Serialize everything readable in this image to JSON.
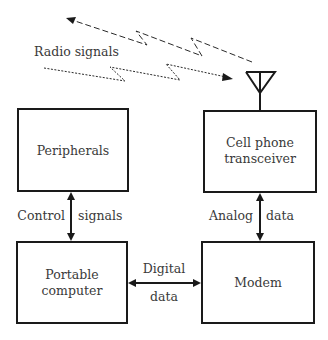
{
  "diagram": {
    "labels": {
      "radio_signals": "Radio signals",
      "control": "Control",
      "signals": "signals",
      "analog": "Analog",
      "analog_data": "data",
      "digital": "Digital",
      "digital_data": "data"
    },
    "nodes": [
      {
        "id": "peripherals",
        "line1": "Peripherals",
        "line2": ""
      },
      {
        "id": "cell_phone_transceiver",
        "line1": "Cell phone",
        "line2": "transceiver"
      },
      {
        "id": "portable_computer",
        "line1": "Portable",
        "line2": "computer"
      },
      {
        "id": "modem",
        "line1": "Modem",
        "line2": ""
      }
    ],
    "edges": [
      {
        "from": "peripherals",
        "to": "portable_computer",
        "label": "Control signals",
        "bidirectional": true
      },
      {
        "from": "cell_phone_transceiver",
        "to": "modem",
        "label": "Analog data",
        "bidirectional": true
      },
      {
        "from": "portable_computer",
        "to": "modem",
        "label": "Digital data",
        "bidirectional": true
      },
      {
        "from": "antenna",
        "to": "air",
        "label": "Radio signals",
        "style": "dashed"
      },
      {
        "from": "air",
        "to": "antenna",
        "label": "Radio signals",
        "style": "dotted"
      }
    ],
    "icons": [
      "antenna-icon"
    ],
    "colors": {
      "line": "#1a1a1a",
      "text": "#3a3a3a",
      "background": "#ffffff"
    }
  }
}
